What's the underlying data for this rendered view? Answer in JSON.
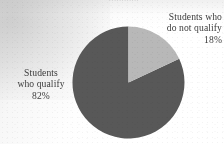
{
  "figure": {
    "title_remnant": "............",
    "background_color": "#ffffff"
  },
  "chart_data": {
    "type": "pie",
    "title": "",
    "xlabel": "",
    "ylabel": "",
    "categories": [
      "Students who qualify",
      "Students who do not qualify"
    ],
    "values": [
      82,
      18
    ],
    "value_unit": "%",
    "colors": [
      "#585858",
      "#b8b8b8"
    ],
    "start_angle_deg": 0,
    "direction": "clockwise",
    "legend": "none",
    "grid": false,
    "labels_placement": "outside-callout",
    "slices": [
      {
        "name": "qualify-slice",
        "label_lines": [
          "Students",
          "who qualify",
          "82%"
        ],
        "percent_text": "82%",
        "value": 82,
        "color": "#585858",
        "label_position": "left"
      },
      {
        "name": "do-not-qualify-slice",
        "label_lines": [
          "Students who",
          "do not qualify",
          "18%"
        ],
        "percent_text": "18%",
        "value": 18,
        "color": "#b8b8b8",
        "label_position": "top-right"
      }
    ]
  },
  "labels": {
    "right": {
      "line1": "Students who",
      "line2": "do not qualify",
      "line3": "18%"
    },
    "left": {
      "line1": "Students",
      "line2": "who qualify",
      "line3": "82%"
    }
  }
}
